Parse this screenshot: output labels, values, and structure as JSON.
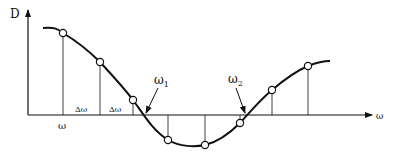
{
  "diagram": {
    "y_axis_label": "D",
    "x_axis_label": "ω",
    "omega_label": "ω",
    "delta_labels": [
      "Δω",
      "Δω"
    ],
    "root_labels": [
      {
        "base": "ω",
        "sub": "1"
      },
      {
        "base": "ω",
        "sub": "2"
      }
    ],
    "colors": {
      "stroke": "#111111",
      "background": "#ffffff"
    },
    "sample_points": [
      {
        "x": 63,
        "y": 33
      },
      {
        "x": 100,
        "y": 62
      },
      {
        "x": 133,
        "y": 100
      },
      {
        "x": 168,
        "y": 140
      },
      {
        "x": 205,
        "y": 145
      },
      {
        "x": 240,
        "y": 123
      },
      {
        "x": 272,
        "y": 90
      },
      {
        "x": 308,
        "y": 66
      }
    ]
  }
}
